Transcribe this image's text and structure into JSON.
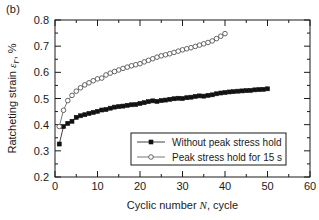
{
  "figure": {
    "panel_label": "(b)",
    "background": "#ffffff",
    "axis_color": "#1a1a1a"
  },
  "chart_data": {
    "type": "scatter",
    "title": "",
    "xlabel": "Cyclic number N, cycle",
    "ylabel": "Ratcheting strain εr, %",
    "ylabel_parts": {
      "prefix": "Ratcheting strain ",
      "symbol": "ε",
      "subscript": "r",
      "suffix": ", %"
    },
    "xlabel_parts": {
      "prefix": "Cyclic number ",
      "symbol": "N",
      "suffix": ", cycle"
    },
    "xlim": [
      0,
      60
    ],
    "ylim": [
      0.2,
      0.8
    ],
    "xticks": [
      0,
      10,
      20,
      30,
      40,
      50,
      60
    ],
    "xtick_labels": [
      "0",
      "10",
      "20",
      "30",
      "40",
      "50",
      "60"
    ],
    "x_minor_interval": 5,
    "yticks": [
      0.2,
      0.3,
      0.4,
      0.5,
      0.6,
      0.7,
      0.8
    ],
    "ytick_labels": [
      "0.2",
      "0.3",
      "0.4",
      "0.5",
      "0.6",
      "0.7",
      "0.8"
    ],
    "y_minor_interval": 0.05,
    "grid": false,
    "legend_position": "lower-right-inside",
    "series": [
      {
        "name": "Without peak stress hold",
        "marker": "filled-square",
        "marker_color": "#111111",
        "line_color": "#111111",
        "x": [
          1,
          2,
          3,
          4,
          5,
          6,
          7,
          8,
          9,
          10,
          11,
          12,
          13,
          14,
          15,
          16,
          17,
          18,
          19,
          20,
          21,
          22,
          23,
          24,
          25,
          26,
          27,
          28,
          29,
          30,
          31,
          32,
          33,
          34,
          35,
          36,
          37,
          38,
          39,
          40,
          41,
          42,
          43,
          44,
          45,
          46,
          47,
          48,
          49,
          50
        ],
        "values": [
          0.326,
          0.393,
          0.405,
          0.413,
          0.428,
          0.434,
          0.438,
          0.443,
          0.447,
          0.451,
          0.456,
          0.458,
          0.463,
          0.467,
          0.469,
          0.471,
          0.474,
          0.476,
          0.477,
          0.481,
          0.484,
          0.488,
          0.491,
          0.489,
          0.492,
          0.494,
          0.497,
          0.499,
          0.501,
          0.5,
          0.503,
          0.505,
          0.508,
          0.51,
          0.509,
          0.512,
          0.514,
          0.518,
          0.521,
          0.523,
          0.525,
          0.526,
          0.528,
          0.529,
          0.53,
          0.531,
          0.533,
          0.534,
          0.535,
          0.537
        ]
      },
      {
        "name": "Peak stress hold for 15 s",
        "marker": "open-circle",
        "marker_color": "#ffffff",
        "line_color": "#555555",
        "x": [
          1,
          2,
          3,
          4,
          5,
          6,
          7,
          8,
          9,
          10,
          11,
          12,
          13,
          14,
          15,
          16,
          17,
          18,
          19,
          20,
          21,
          22,
          23,
          24,
          25,
          26,
          27,
          28,
          29,
          30,
          31,
          32,
          33,
          34,
          35,
          36,
          37,
          38,
          39,
          40
        ],
        "values": [
          0.393,
          0.455,
          0.492,
          0.512,
          0.528,
          0.541,
          0.552,
          0.56,
          0.568,
          0.575,
          0.578,
          0.59,
          0.597,
          0.603,
          0.609,
          0.615,
          0.62,
          0.625,
          0.629,
          0.633,
          0.64,
          0.646,
          0.652,
          0.658,
          0.663,
          0.667,
          0.671,
          0.676,
          0.681,
          0.686,
          0.69,
          0.694,
          0.699,
          0.704,
          0.709,
          0.714,
          0.72,
          0.729,
          0.738,
          0.748
        ]
      }
    ]
  },
  "legend": {
    "entries": [
      {
        "label": "Without peak stress hold",
        "marker": "filled-square"
      },
      {
        "label": "Peak stress hold for 15 s",
        "marker": "open-circle"
      }
    ]
  }
}
